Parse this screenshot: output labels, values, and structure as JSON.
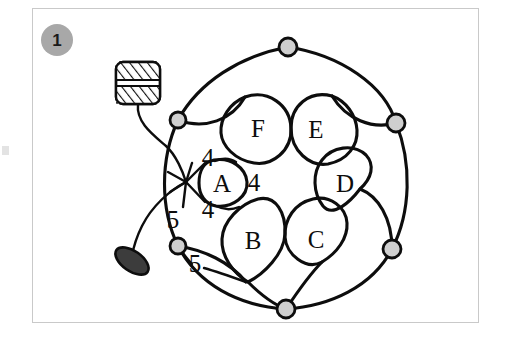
{
  "figure": {
    "badge_label": "1",
    "caption": "",
    "background_color": "#ffffff",
    "frame_color": "#c9c9c9",
    "stroke_color": "#0d0d0d",
    "node_fill_color": "#cfcfcf",
    "badge_fill_color": "#a8a8a8"
  },
  "diagram": {
    "lobes": [
      {
        "id": "A",
        "label": "A",
        "cx": 226,
        "cy": 182,
        "angle_deg": 180
      },
      {
        "id": "B",
        "label": "B",
        "cx": 254,
        "cy": 240,
        "angle_deg": 240
      },
      {
        "id": "C",
        "label": "C",
        "cx": 315,
        "cy": 239,
        "angle_deg": 300
      },
      {
        "id": "D",
        "label": "D",
        "cx": 345,
        "cy": 183,
        "angle_deg": 0
      },
      {
        "id": "E",
        "label": "E",
        "cx": 315,
        "cy": 128,
        "angle_deg": 60
      },
      {
        "id": "F",
        "label": "F",
        "cx": 258,
        "cy": 127,
        "angle_deg": 120
      }
    ],
    "outer_nodes": [
      {
        "id": "n-top",
        "cx": 288,
        "cy": 47
      },
      {
        "id": "n-upper-right",
        "cx": 396,
        "cy": 123
      },
      {
        "id": "n-lower-right",
        "cx": 392,
        "cy": 249
      },
      {
        "id": "n-bottom",
        "cx": 286,
        "cy": 309
      },
      {
        "id": "n-lower-left",
        "cx": 178,
        "cy": 246
      },
      {
        "id": "n-upper-left",
        "cx": 178,
        "cy": 120
      }
    ],
    "edge_weights": [
      {
        "id": "w-top",
        "value": "4",
        "x": 208,
        "y": 166
      },
      {
        "id": "w-right",
        "value": "4",
        "x": 254,
        "y": 191
      },
      {
        "id": "w-bottom",
        "value": "4",
        "x": 208,
        "y": 218
      },
      {
        "id": "w-left-upper",
        "value": "5",
        "x": 173,
        "y": 228
      },
      {
        "id": "w-left-lower",
        "value": "5",
        "x": 195,
        "y": 270
      }
    ],
    "hatched_block": {
      "id": "hatched-block",
      "x": 116,
      "y": 62,
      "width": 44,
      "height": 42
    },
    "dark_ellipse": {
      "id": "dark-ellipse",
      "cx": 132,
      "cy": 261,
      "rx": 19,
      "ry": 10,
      "rotation_deg": 35,
      "fill": "#3c3c3c"
    },
    "junction": {
      "id": "junction-point",
      "x": 186,
      "y": 182
    }
  }
}
